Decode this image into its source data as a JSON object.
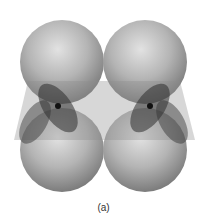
{
  "figure": {
    "spheres": [
      {
        "name": "top-left",
        "cx": 62,
        "cy": 62,
        "r": 42
      },
      {
        "name": "top-right",
        "cx": 145,
        "cy": 62,
        "r": 42
      },
      {
        "name": "bottom-left",
        "cx": 62,
        "cy": 150,
        "r": 42
      },
      {
        "name": "bottom-right",
        "cx": 145,
        "cy": 150,
        "r": 42
      }
    ],
    "colors": {
      "sphere_light": "#d8d8d8",
      "sphere_dark": "#7a7a7a",
      "plane": "#9a9a9a",
      "overlap": "#3a3a3a"
    }
  },
  "caption": "(a)"
}
